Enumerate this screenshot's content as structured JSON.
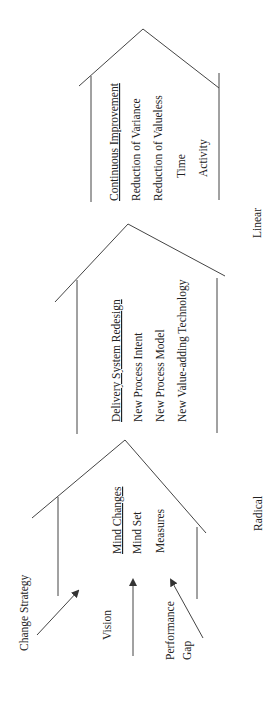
{
  "diagram": {
    "houses": [
      {
        "id": "radical",
        "title": "Mind Changes",
        "items": [
          "Mind Set",
          "Measures"
        ]
      },
      {
        "id": "redesign",
        "title": "Delivery System Redesign",
        "items": [
          "New Process Intent",
          "New Process Model",
          "New Value-adding Technology"
        ]
      },
      {
        "id": "linear",
        "title": "Continuous Improvement",
        "items": [
          "Reduction of Variance",
          "Reduction of Valueless",
          "Time",
          "Activity"
        ]
      }
    ],
    "inputs": {
      "change_strategy": "Change Strategy",
      "vision": "Vision",
      "performance": "Performance",
      "gap": "Gap"
    },
    "axis": {
      "radical": "Radical",
      "linear": "Linear"
    },
    "colors": {
      "line": "#444444",
      "text": "#222222",
      "background": "#ffffff"
    }
  }
}
